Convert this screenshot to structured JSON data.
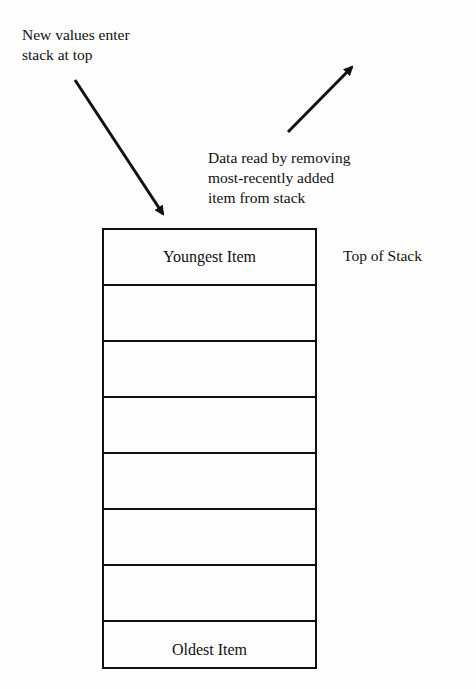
{
  "labels": {
    "push": "New values enter\nstack at top",
    "pop": "Data read by removing\nmost-recently added\nitem from stack",
    "top_of_stack": "Top of Stack"
  },
  "stack": {
    "cells": [
      "Youngest Item",
      "",
      "",
      "",
      "",
      "",
      "",
      "Oldest Item"
    ]
  },
  "arrows": {
    "push": {
      "from": [
        75,
        80
      ],
      "to": [
        165,
        218
      ],
      "direction": "down-right"
    },
    "pop": {
      "from": [
        288,
        132
      ],
      "to": [
        355,
        63
      ],
      "direction": "up-right"
    }
  }
}
